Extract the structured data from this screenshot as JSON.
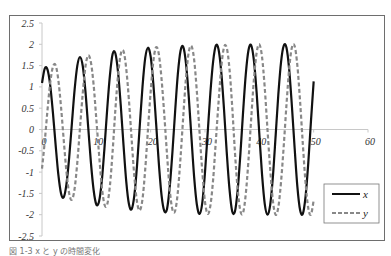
{
  "caption": "図 1-3  x と y の時間変化",
  "chart_data": {
    "type": "line",
    "title": "",
    "xlabel": "",
    "ylabel": "",
    "xlim": [
      0,
      60
    ],
    "ylim": [
      -2.5,
      2.5
    ],
    "x_ticks": [
      0,
      10,
      20,
      30,
      40,
      50,
      60
    ],
    "y_ticks": [
      2.5,
      2,
      1.5,
      1,
      0.5,
      0,
      -0.5,
      -1,
      -1.5,
      -2,
      -2.5
    ],
    "grid": false,
    "legend_position": "lower right",
    "x": [
      0,
      0.5,
      1,
      1.5,
      2,
      2.5,
      3,
      3.5,
      4,
      4.5,
      5,
      5.5,
      6,
      6.5,
      7,
      7.5,
      8,
      8.5,
      9,
      9.5,
      10,
      10.5,
      11,
      11.5,
      12,
      12.5,
      13,
      13.5,
      14,
      14.5,
      15,
      15.5,
      16,
      16.5,
      17,
      17.5,
      18,
      18.5,
      19,
      19.5,
      20,
      20.5,
      21,
      21.5,
      22,
      22.5,
      23,
      23.5,
      24,
      24.5,
      25,
      25.5,
      26,
      26.5,
      27,
      27.5,
      28,
      28.5,
      29,
      29.5,
      30,
      30.5,
      31,
      31.5,
      32,
      32.5,
      33,
      33.5,
      34,
      34.5,
      35,
      35.5,
      36,
      36.5,
      37,
      37.5,
      38,
      38.5,
      39,
      39.5,
      40,
      40.5,
      41,
      41.5,
      42,
      42.5,
      43,
      43.5,
      44,
      44.5,
      45,
      45.5,
      46,
      46.5,
      47,
      47.5,
      48,
      48.5,
      49,
      49.5,
      50
    ],
    "series": [
      {
        "name": "x",
        "style": "solid",
        "color": "#111111",
        "values": [
          1.09,
          1.43,
          1.41,
          1.05,
          0.41,
          -0.35,
          -1.05,
          -1.5,
          -1.59,
          -1.28,
          -0.66,
          0.14,
          0.93,
          1.5,
          1.7,
          1.49,
          0.89,
          0.06,
          -0.77,
          -1.42,
          -1.76,
          -1.69,
          -1.22,
          -0.43,
          0.48,
          1.27,
          1.77,
          1.79,
          1.34,
          0.56,
          -0.36,
          -1.21,
          -1.75,
          -1.87,
          -1.54,
          -0.83,
          0.1,
          1.01,
          1.68,
          1.92,
          1.71,
          1.06,
          0.15,
          -0.79,
          -1.54,
          -1.91,
          -1.87,
          -1.36,
          -0.54,
          0.42,
          1.3,
          1.85,
          1.94,
          1.55,
          0.79,
          -0.18,
          -1.11,
          -1.76,
          -1.98,
          -1.72,
          -1.01,
          -0.06,
          0.88,
          1.6,
          1.97,
          1.88,
          1.34,
          0.47,
          -0.53,
          -1.39,
          -1.92,
          -1.93,
          -1.44,
          -0.6,
          0.39,
          1.29,
          1.86,
          1.98,
          1.62,
          0.87,
          -0.11,
          -1.06,
          -1.75,
          -2.0,
          -1.77,
          -1.1,
          -0.15,
          0.83,
          1.59,
          1.97,
          1.92,
          1.4,
          0.54,
          -0.44,
          -1.34,
          -1.89,
          -1.98,
          -1.58,
          -0.8,
          0.19,
          1.13
        ]
      },
      {
        "name": "y",
        "style": "dashed",
        "color": "#888888",
        "values": [
          -0.92,
          -0.29,
          0.44,
          1.08,
          1.47,
          1.51,
          1.17,
          0.53,
          -0.25,
          -0.99,
          -1.5,
          -1.65,
          -1.39,
          -0.77,
          0.05,
          0.85,
          1.48,
          1.74,
          1.58,
          1.05,
          0.24,
          -0.58,
          -1.33,
          -1.76,
          -1.76,
          -1.32,
          -0.51,
          0.46,
          1.28,
          1.77,
          1.84,
          1.43,
          0.69,
          -0.23,
          -1.11,
          -1.71,
          -1.9,
          -1.63,
          -0.93,
          -0.01,
          0.89,
          1.61,
          1.93,
          1.77,
          1.19,
          0.36,
          -0.57,
          -1.4,
          -1.88,
          -1.91,
          -1.47,
          -0.65,
          0.31,
          1.21,
          1.81,
          1.96,
          1.64,
          0.89,
          -0.07,
          -0.98,
          -1.7,
          -1.98,
          -1.78,
          -1.17,
          -0.26,
          0.65,
          1.47,
          1.93,
          1.92,
          1.43,
          0.55,
          -0.51,
          -1.38,
          -1.9,
          -1.96,
          -1.52,
          -0.72,
          0.25,
          1.17,
          1.8,
          2.0,
          1.7,
          0.97,
          0.0,
          -0.93,
          -1.68,
          -2.0,
          -1.82,
          -1.22,
          -0.37,
          0.59,
          1.44,
          1.93,
          1.96,
          1.5,
          0.66,
          -0.33,
          -1.24,
          -1.84,
          -2.0,
          -1.66
        ]
      }
    ]
  },
  "legend": {
    "items": [
      {
        "label": "x",
        "style": "solid"
      },
      {
        "label": "y",
        "style": "dashed"
      }
    ]
  }
}
